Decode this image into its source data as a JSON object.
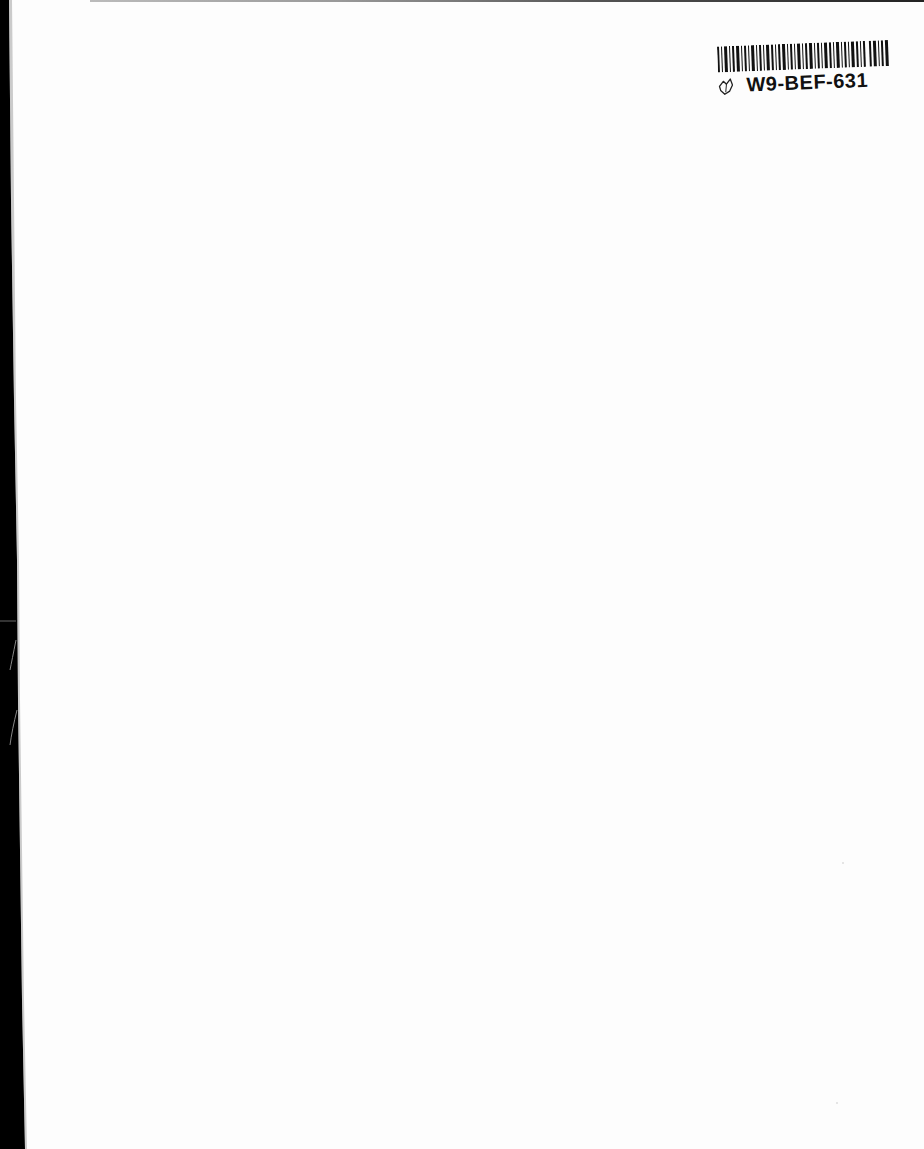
{
  "document": {
    "type": "scanned-blank-page",
    "background_color": "#fdfdfd",
    "binding_edge_color": "#000000"
  },
  "barcode_label": {
    "code": "W9-BEF-631",
    "icon": "hand-drawn-heart-icon"
  }
}
